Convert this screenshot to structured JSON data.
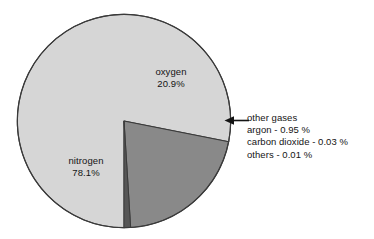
{
  "chart_data": {
    "type": "pie",
    "title": "",
    "subtitle": "",
    "xlabel": "",
    "ylabel": "",
    "units": "%",
    "legend_position": "none",
    "grid": false,
    "categories": [
      "nitrogen",
      "oxygen",
      "other gases"
    ],
    "values": [
      78.1,
      20.9,
      0.99
    ],
    "slices": [
      {
        "name": "nitrogen",
        "label": "nitrogen",
        "value": 78.1,
        "value_label": "78.1%",
        "color": "#d6d6d6",
        "start_angle": 0.0,
        "end_angle": 281.16,
        "label_placement": "inside"
      },
      {
        "name": "oxygen",
        "label": "oxygen",
        "value": 20.9,
        "value_label": "20.9%",
        "color": "#898989",
        "start_angle": 281.16,
        "end_angle": 356.4,
        "label_placement": "inside"
      },
      {
        "name": "other gases",
        "label": "other gases",
        "value": 0.99,
        "value_label": "",
        "color": "#565656",
        "start_angle": 356.4,
        "end_angle": 360.0,
        "label_placement": "callout"
      }
    ],
    "annotations": [
      {
        "name": "other-gases-callout",
        "lines": [
          "other gases",
          "argon - 0.95 %",
          "carbon dioxide - 0.03 %",
          "others - 0.01 %"
        ],
        "arrow": "left-arrow",
        "points_to": "other gases"
      }
    ],
    "breakdown": [
      {
        "name": "argon",
        "text": "argon - 0.95 %",
        "value": 0.95
      },
      {
        "name": "carbon dioxide",
        "text": "carbon dioxide - 0.03 %",
        "value": 0.03
      },
      {
        "name": "others",
        "text": "others - 0.01 %",
        "value": 0.01
      }
    ]
  },
  "labels": {
    "oxygen": {
      "name": "oxygen",
      "percent": "20.9%"
    },
    "nitrogen": {
      "name": "nitrogen",
      "percent": "78.1%"
    }
  },
  "callout": {
    "title": "other gases",
    "line_argon": "argon - 0.95 %",
    "line_carbon_dioxide": "carbon dioxide - 0.03 %",
    "line_others": "others - 0.01 %"
  },
  "colors": {
    "nitrogen": "#d6d6d6",
    "oxygen": "#898989",
    "other_gases": "#565656",
    "outline": "#3a3a3a",
    "background": "#ffffff",
    "text": "#141414"
  }
}
